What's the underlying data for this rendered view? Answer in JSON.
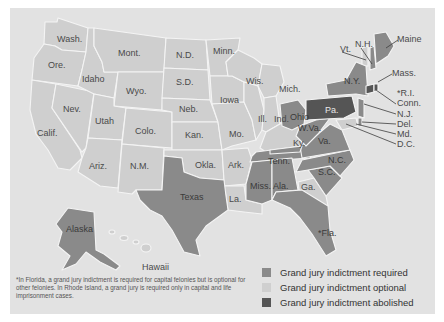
{
  "map": {
    "type": "choropleth",
    "region": "United States",
    "colors": {
      "background": "#e2e2e2",
      "required": "#8a8a8a",
      "optional": "#cfcfcf",
      "abolished": "#555555",
      "border": "#f4f4f4"
    },
    "states": {
      "wa": "Wash.",
      "or": "Ore.",
      "ca": "Calif.",
      "nv": "Nev.",
      "id": "Idaho",
      "mt": "Mont.",
      "wy": "Wyo.",
      "ut": "Utah",
      "az": "Ariz.",
      "co": "Colo.",
      "nm": "N.M.",
      "nd": "N.D.",
      "sd": "S.D.",
      "ne": "Neb.",
      "ks": "Kan.",
      "ok": "Okla.",
      "tx": "Texas",
      "mn": "Minn.",
      "ia": "Iowa",
      "mo": "Mo.",
      "ar": "Ark.",
      "la": "La.",
      "wi": "Wis.",
      "il": "Ill.",
      "mi": "Mich.",
      "in": "Ind.",
      "oh": "Ohio",
      "ky": "Ky.",
      "tn": "Tenn.",
      "ms": "Miss.",
      "al": "Ala.",
      "ga": "Ga.",
      "fl": "*Fla.",
      "sc": "S.C.",
      "nc": "N.C.",
      "va": "Va.",
      "wv": "W.Va.",
      "pa": "Pa.",
      "ny": "N.Y.",
      "vt": "Vt.",
      "nh": "N.H.",
      "me": "Maine",
      "ma": "Mass.",
      "ri": "*R.I.",
      "ct": "Conn.",
      "nj": "N.J.",
      "de": "Del.",
      "md": "Md.",
      "dc": "D.C.",
      "ak": "Alaska",
      "hi": "Hawaii"
    },
    "categories": {
      "required": [
        "Texas",
        "Tenn.",
        "Miss.",
        "Ala.",
        "S.C.",
        "N.C.",
        "Va.",
        "W.Va.",
        "Ohio",
        "N.Y.",
        "N.H.",
        "Maine",
        "Mass.",
        "N.J.",
        "Del.",
        "D.C.",
        "Alaska",
        "*Fla.",
        "Ky."
      ],
      "optional": [
        "Wash.",
        "Ore.",
        "Calif.",
        "Nev.",
        "Idaho",
        "Mont.",
        "Wyo.",
        "Utah",
        "Ariz.",
        "Colo.",
        "N.M.",
        "N.D.",
        "S.D.",
        "Neb.",
        "Kan.",
        "Okla.",
        "Minn.",
        "Iowa",
        "Mo.",
        "Ark.",
        "La.",
        "Wis.",
        "Ill.",
        "Mich.",
        "Ind.",
        "Ga.",
        "Vt.",
        "Md.",
        "Hawaii"
      ],
      "abolished": [
        "Pa.",
        "Conn.",
        "*R.I."
      ]
    }
  },
  "legend": {
    "items": [
      {
        "label": "Grand jury indictment required",
        "color": "#8a8a8a"
      },
      {
        "label": "Grand jury indictment optional",
        "color": "#cfcfcf"
      },
      {
        "label": "Grand jury indictment abolished",
        "color": "#555555"
      }
    ]
  },
  "footnote": "*In Florida, a grand jury indictment is required for capital felonies but is optional for other felonies. In Rhode Island, a grand jury is required only in capital and life imprisonment cases."
}
